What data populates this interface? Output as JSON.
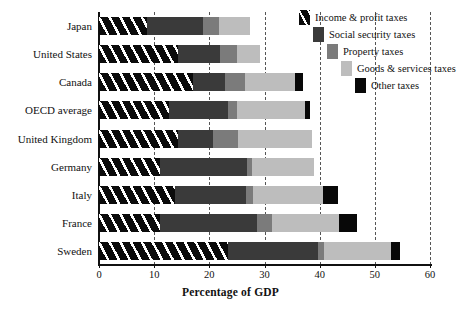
{
  "chart_data": {
    "type": "bar",
    "orientation": "horizontal",
    "stacked": true,
    "title": "",
    "xlabel": "Percentage of GDP",
    "ylabel": "",
    "xlim": [
      0,
      60
    ],
    "xticks": [
      0,
      10,
      20,
      30,
      40,
      50,
      60
    ],
    "xtick_labels": [
      "0",
      "10",
      "20",
      "30",
      "40",
      "50",
      "60"
    ],
    "grid": "vertical dashed gridlines at every x tick",
    "legend_position": "top-right, staircase layout",
    "categories": [
      "Japan",
      "United States",
      "Canada",
      "OECD average",
      "United Kingdom",
      "Germany",
      "Italy",
      "France",
      "Sweden"
    ],
    "series": [
      {
        "name": "Income & profit taxes",
        "color": "#0b0b0b",
        "pattern": "diagonal-hatch",
        "values": [
          8.7,
          14.3,
          17.0,
          12.7,
          14.3,
          11.0,
          13.8,
          11.0,
          23.4
        ]
      },
      {
        "name": "Social security taxes",
        "color": "#3a3a3a",
        "values": [
          10.1,
          7.6,
          5.8,
          10.7,
          6.3,
          15.8,
          12.8,
          17.6,
          16.3
        ]
      },
      {
        "name": "Property taxes",
        "color": "#7b7b7b",
        "values": [
          2.9,
          3.1,
          3.6,
          1.6,
          4.6,
          0.9,
          1.3,
          2.7,
          1.1
        ]
      },
      {
        "name": "Goods & services taxes",
        "color": "#bdbdbd",
        "values": [
          5.6,
          4.2,
          9.1,
          12.3,
          13.4,
          11.3,
          12.7,
          12.3,
          12.2
        ]
      },
      {
        "name": "Other taxes",
        "color": "#080808",
        "values": [
          0.0,
          0.0,
          1.5,
          0.9,
          0.0,
          0.0,
          2.7,
          3.1,
          1.5
        ]
      }
    ],
    "totals": [
      27.3,
      29.2,
      37.0,
      38.2,
      38.6,
      39.0,
      43.3,
      46.7,
      54.5
    ]
  }
}
